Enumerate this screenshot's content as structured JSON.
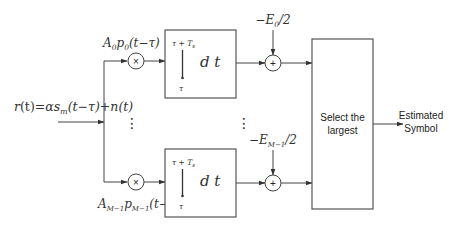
{
  "diagram": {
    "input_label": "r(t) = αs_m(t−τ) + n(t)",
    "input_label_parts": {
      "lhs": "r",
      "arg": "(t)",
      "eq": "=",
      "alpha": "αs",
      "sub": "m",
      "rest": "(t−τ)+n(t)"
    },
    "branches": [
      {
        "id": "branch-0",
        "weight_label": "A₀p₀(t−τ)",
        "weight_parts": {
          "A": "A",
          "Asub": "0",
          "p": "p",
          "psub": "0",
          "arg": "(t−τ)"
        },
        "multiplier_symbol": "×",
        "integrator": {
          "upper_limit": "τ + T",
          "upper_sub": "s",
          "lower_limit": "τ",
          "integral_sign": "∫",
          "differential": "d t"
        },
        "bias_label": "−E₀/2",
        "bias_parts": {
          "minus": "−E",
          "sub": "0",
          "rest": "/2"
        },
        "summer_symbol": "+"
      },
      {
        "id": "branch-M-1",
        "weight_label": "A_{M−1}p_{M−1}(t−τ)",
        "weight_parts": {
          "A": "A",
          "Asub": "M−1",
          "p": "p",
          "psub": "M−1",
          "arg": "(t−τ)"
        },
        "multiplier_symbol": "×",
        "integrator": {
          "upper_limit": "τ + T",
          "upper_sub": "s",
          "lower_limit": "τ",
          "integral_sign": "∫",
          "differential": "d t"
        },
        "bias_label": "−E_{M−1}/2",
        "bias_parts": {
          "minus": "−E",
          "sub": "M−1",
          "rest": "/2"
        },
        "summer_symbol": "+"
      }
    ],
    "ellipsis": "⋮",
    "selector": {
      "line1": "Select the",
      "line2": "largest"
    },
    "output": {
      "line1": "Estimated",
      "line2": "Symbol"
    },
    "colors": {
      "line": "#444444",
      "box": "#555555",
      "text": "#333333",
      "background": "#ffffff"
    }
  }
}
